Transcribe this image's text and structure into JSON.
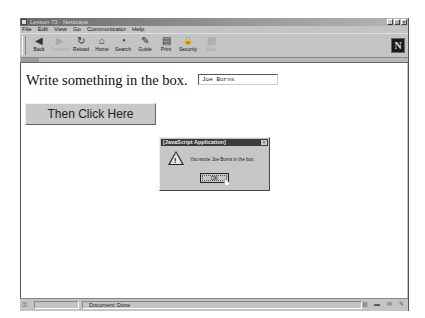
{
  "window": {
    "title": "Lesson 73 - Netscape",
    "controls": {
      "minimize": "_",
      "maximize": "□",
      "close": "×"
    }
  },
  "menubar": {
    "items": [
      {
        "label": "File"
      },
      {
        "label": "Edit"
      },
      {
        "label": "View"
      },
      {
        "label": "Go"
      },
      {
        "label": "Communicator"
      },
      {
        "label": "Help"
      }
    ]
  },
  "toolbar": {
    "buttons": [
      {
        "label": "Back",
        "icon": "back-icon",
        "glyph": "◀",
        "enabled": true
      },
      {
        "label": "Forward",
        "icon": "forward-icon",
        "glyph": "▶",
        "enabled": false
      },
      {
        "label": "Reload",
        "icon": "reload-icon",
        "glyph": "↻",
        "enabled": true
      },
      {
        "label": "Home",
        "icon": "home-icon",
        "glyph": "⌂",
        "enabled": true
      },
      {
        "label": "Search",
        "icon": "search-icon",
        "glyph": "◔",
        "enabled": true
      },
      {
        "label": "Guide",
        "icon": "guide-icon",
        "glyph": "✎",
        "enabled": true
      },
      {
        "label": "Print",
        "icon": "print-icon",
        "glyph": "▤",
        "enabled": true
      },
      {
        "label": "Security",
        "icon": "security-icon",
        "glyph": "🔒",
        "enabled": true
      },
      {
        "label": "Stop",
        "icon": "stop-icon",
        "glyph": "▦",
        "enabled": false
      }
    ],
    "logo": "N"
  },
  "location": {
    "tab_label": "Bookmarks"
  },
  "page": {
    "prompt": "Write something in the box.",
    "textbox_value": "Joe Burns",
    "button_label": "Then Click Here"
  },
  "dialog": {
    "title": "[JavaScript Application]",
    "close": "×",
    "icon": "warning-icon",
    "bang": "!",
    "message": "You wrote Joe Burns in the box.",
    "ok_label": "OK"
  },
  "statusbar": {
    "status_text": "Document: Done",
    "icons": [
      "▥",
      "▬",
      "✉",
      "✎"
    ]
  }
}
